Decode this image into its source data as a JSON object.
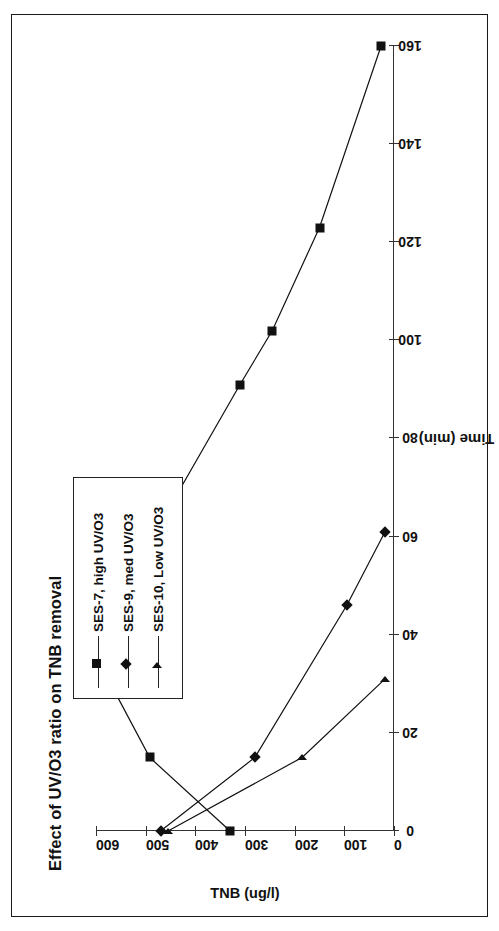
{
  "chart_data": {
    "type": "line",
    "title": "Effect of UV/O3 ratio on TNB removal",
    "orientation": "rotated-90",
    "xlabel": "Time (min)",
    "ylabel": "TNB (ug/l)",
    "xlim": [
      0,
      160
    ],
    "ylim": [
      0,
      600
    ],
    "xticks": [
      0,
      20,
      40,
      60,
      80,
      100,
      120,
      140,
      160
    ],
    "yticks": [
      0,
      100,
      200,
      300,
      400,
      500,
      600
    ],
    "xtick_labels": [
      "0",
      "20",
      "40",
      "60",
      "80",
      "100",
      "120",
      "140",
      "160"
    ],
    "ytick_labels": [
      "0",
      "100",
      "200",
      "300",
      "400",
      "500",
      "600"
    ],
    "grid": false,
    "legend_position": "upper-center",
    "series": [
      {
        "name": "SES-7, high UV/O3",
        "marker": "square",
        "x": [
          0,
          15,
          31,
          46,
          51,
          61,
          91,
          102,
          123,
          160
        ],
        "y": [
          330,
          492,
          576,
          540,
          525,
          480,
          310,
          245,
          150,
          26
        ]
      },
      {
        "name": "SES-9, med UV/O3",
        "marker": "diamond",
        "x": [
          0,
          15,
          46,
          61
        ],
        "y": [
          470,
          280,
          95,
          18
        ]
      },
      {
        "name": "SES-10, Low UV/O3",
        "marker": "triangle",
        "x": [
          0,
          15,
          31
        ],
        "y": [
          455,
          185,
          18
        ]
      }
    ]
  },
  "legend": {
    "items": [
      {
        "label": "SES-7, high UV/O3",
        "marker": "square"
      },
      {
        "label": "SES-9, med UV/O3",
        "marker": "diamond"
      },
      {
        "label": "SES-10, Low UV/O3",
        "marker": "triangle"
      }
    ]
  },
  "colors": {
    "ink": "#111111",
    "axis": "#333333",
    "page": "#ffffff",
    "border": "#1a1a1a"
  }
}
